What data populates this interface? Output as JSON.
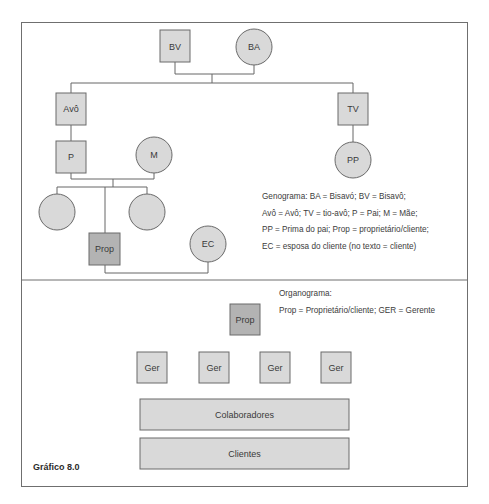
{
  "figure": {
    "caption": "Gráfico 8.0",
    "colors": {
      "frame": "#6f6f6f",
      "node_fill": "#d9d9d9",
      "node_fill_dark": "#b3b3b3",
      "node_stroke": "#6a6a6a",
      "line": "#666666",
      "text": "#3a3a3a"
    }
  },
  "genogram": {
    "nodes": {
      "bv": {
        "label": "BV",
        "shape": "square"
      },
      "ba": {
        "label": "BA",
        "shape": "circle"
      },
      "avo": {
        "label": "Avô",
        "shape": "square"
      },
      "tv": {
        "label": "TV",
        "shape": "square"
      },
      "p": {
        "label": "P",
        "shape": "square"
      },
      "m": {
        "label": "M",
        "shape": "circle"
      },
      "pp": {
        "label": "PP",
        "shape": "circle"
      },
      "sibling_left": {
        "label": "",
        "shape": "circle"
      },
      "sibling_right": {
        "label": "",
        "shape": "circle"
      },
      "prop": {
        "label": "Prop",
        "shape": "square",
        "highlighted": true
      },
      "ec": {
        "label": "EC",
        "shape": "circle"
      }
    },
    "legend": {
      "lines": [
        "Genograma: BA = Bisavó; BV = Bisavô;",
        "Avô = Avô; TV = tio-avô; P = Pai; M = Mãe;",
        "PP = Prima do pai; Prop = proprietário/cliente;",
        "EC = esposa do cliente (no texto = cliente)"
      ]
    }
  },
  "organogram": {
    "top": {
      "label": "Prop"
    },
    "managers": [
      {
        "label": "Ger"
      },
      {
        "label": "Ger"
      },
      {
        "label": "Ger"
      },
      {
        "label": "Ger"
      }
    ],
    "layers": [
      {
        "label": "Colaboradores"
      },
      {
        "label": "Clientes"
      }
    ],
    "legend": {
      "lines": [
        "Organograma:",
        "Prop = Proprietário/cliente; GER = Gerente"
      ]
    }
  }
}
